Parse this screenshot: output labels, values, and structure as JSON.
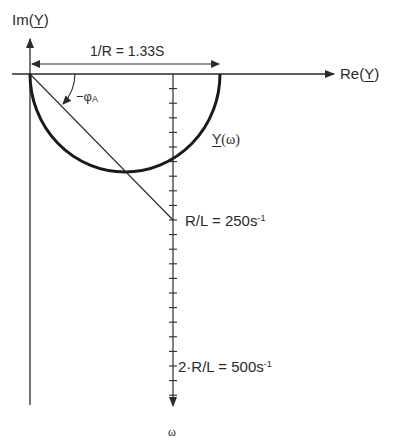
{
  "axes": {
    "imag_label_prefix": "Im(",
    "imag_label_var": "Y",
    "imag_label_suffix": ")",
    "real_label_prefix": "Re(",
    "real_label_var": "Y",
    "real_label_suffix": ")",
    "omega_label": "ω"
  },
  "annotations": {
    "conductance": "1/R = 1.33S",
    "angle_prefix": "−φ",
    "angle_sub": "A",
    "locus_var": "Y",
    "locus_arg": "(ω)",
    "rl_label": "R/L = 250s",
    "rl_sup": "-1",
    "two_rl_label": "2·R/L = 500s",
    "two_rl_sup": "-1"
  },
  "geometry": {
    "origin": [
      30,
      74
    ],
    "semicircle_center_x": 125,
    "semicircle_radius": 95,
    "omega_axis_x": 173,
    "omega_tick_spacing": 14.6,
    "omega_tick_count": 22,
    "rl_mark_y": 220,
    "two_rl_mark_y": 366
  },
  "colors": {
    "ink": "#2a2a2a",
    "background": "#ffffff"
  }
}
